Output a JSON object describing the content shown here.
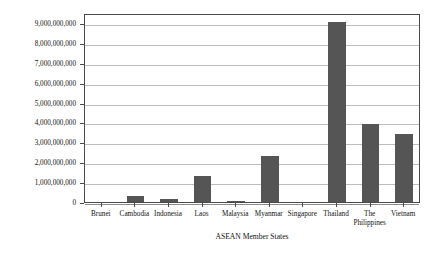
{
  "chart_data": {
    "type": "bar",
    "title": "",
    "xlabel": "ASEAN Member States",
    "ylabel": "Trade Value (USD)",
    "categories": [
      "Brunei",
      "Cambodia",
      "Indonesia",
      "Laos",
      "Malaysia",
      "Myanmar",
      "Singapore",
      "Thailand",
      "The Philippines",
      "Vietnam"
    ],
    "category_lines": [
      [
        "Brunei"
      ],
      [
        "Cambodia"
      ],
      [
        "Indonesia"
      ],
      [
        "Laos"
      ],
      [
        "Malaysia"
      ],
      [
        "Myanmar"
      ],
      [
        "Singapore"
      ],
      [
        "Thailand"
      ],
      [
        "The",
        "Philippines"
      ],
      [
        "Vietnam"
      ]
    ],
    "values": [
      0,
      300000000,
      150000000,
      1300000000,
      60000000,
      2300000000,
      0,
      9050000000,
      3900000000,
      3400000000
    ],
    "ylim": [
      0,
      9500000000
    ],
    "yticks": [
      0,
      1000000000,
      2000000000,
      3000000000,
      4000000000,
      5000000000,
      6000000000,
      7000000000,
      8000000000,
      9000000000
    ],
    "ytick_labels": [
      "0",
      "1,000,000,000",
      "2,000,000,000",
      "3,000,000,000",
      "4,000,000,000",
      "5,000,000,000",
      "6,000,000,000",
      "7,000,000,000",
      "8,000,000,000",
      "9,000,000,000"
    ],
    "grid": true,
    "legend": false,
    "bar_color": "#555555",
    "grid_color": "#bdbdbd",
    "axis_color": "#4a4a4a"
  }
}
